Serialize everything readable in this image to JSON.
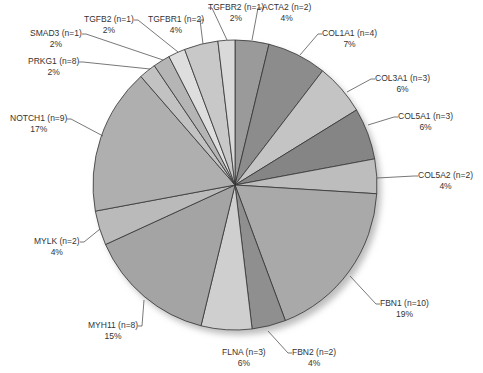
{
  "chart_data": {
    "type": "pie",
    "title": "",
    "start_angle_deg": 0,
    "direction": "clockwise",
    "slices": [
      {
        "label": "ACTA2 (n=2)",
        "gene": "ACTA2",
        "n": 2,
        "pct_label": "4%",
        "pct": 4,
        "color": "#9a9a9a"
      },
      {
        "label": "COL1A1 (n=4)",
        "gene": "COL1A1",
        "n": 4,
        "pct_label": "7%",
        "pct": 7,
        "color": "#8c8c8c"
      },
      {
        "label": "COL3A1 (n=3)",
        "gene": "COL3A1",
        "n": 3,
        "pct_label": "6%",
        "pct": 6,
        "color": "#c4c4c4"
      },
      {
        "label": "COL5A1 (n=3)",
        "gene": "COL5A1",
        "n": 3,
        "pct_label": "6%",
        "pct": 6,
        "color": "#858585"
      },
      {
        "label": "COL5A2 (n=2)",
        "gene": "COL5A2",
        "n": 2,
        "pct_label": "4%",
        "pct": 4,
        "color": "#bdbdbd"
      },
      {
        "label": "FBN1 (n=10)",
        "gene": "FBN1",
        "n": 10,
        "pct_label": "19%",
        "pct": 19,
        "color": "#a9a9a9"
      },
      {
        "label": "FBN2 (n=2)",
        "gene": "FBN2",
        "n": 2,
        "pct_label": "4%",
        "pct": 4,
        "color": "#8f8f8f"
      },
      {
        "label": "FLNA (n=3)",
        "gene": "FLNA",
        "n": 3,
        "pct_label": "6%",
        "pct": 6,
        "color": "#cfcfcf"
      },
      {
        "label": "MYH11 (n=8)",
        "gene": "MYH11",
        "n": 8,
        "pct_label": "15%",
        "pct": 15,
        "color": "#a4a4a4"
      },
      {
        "label": "MYLK (n=2)",
        "gene": "MYLK",
        "n": 2,
        "pct_label": "4%",
        "pct": 4,
        "color": "#bababa"
      },
      {
        "label": "NOTCH1 (n=9)",
        "gene": "NOTCH1",
        "n": 9,
        "pct_label": "17%",
        "pct": 17,
        "color": "#afafaf"
      },
      {
        "label": "PRKG1 (n=8)",
        "gene": "PRKG1",
        "n": 8,
        "pct_label": "2%",
        "pct": 2,
        "color": "#c2c2c2"
      },
      {
        "label": "SMAD3 (n=1)",
        "gene": "SMAD3",
        "n": 1,
        "pct_label": "2%",
        "pct": 2,
        "color": "#b5b5b5"
      },
      {
        "label": "TGFB2 (n=1)",
        "gene": "TGFB2",
        "n": 1,
        "pct_label": "2%",
        "pct": 2,
        "color": "#dedede"
      },
      {
        "label": "TGFBR1 (n=2)",
        "gene": "TGFBR1",
        "n": 2,
        "pct_label": "4%",
        "pct": 4,
        "color": "#c8c8c8"
      },
      {
        "label": "TGFBR2 (n=1)",
        "gene": "TGFBR2",
        "n": 1,
        "pct_label": "2%",
        "pct": 2,
        "color": "#d9d9d9"
      }
    ],
    "categories": [
      "ACTA2",
      "COL1A1",
      "COL3A1",
      "COL5A1",
      "COL5A2",
      "FBN1",
      "FBN2",
      "FLNA",
      "MYH11",
      "MYLK",
      "NOTCH1",
      "PRKG1",
      "SMAD3",
      "TGFB2",
      "TGFBR1",
      "TGFBR2"
    ],
    "values": [
      4,
      7,
      6,
      6,
      4,
      19,
      4,
      6,
      15,
      4,
      17,
      2,
      2,
      2,
      4,
      2
    ],
    "counts": [
      2,
      4,
      3,
      3,
      2,
      10,
      2,
      3,
      8,
      2,
      9,
      8,
      1,
      1,
      2,
      1
    ],
    "legend": "none (leader-line labels)",
    "grid": false
  },
  "labels": [
    {
      "name": "ACTA2",
      "line1": "ACTA2 (n=2)",
      "line2": "4%",
      "x": 262,
      "y": 2,
      "ax": 252,
      "ay": 40
    },
    {
      "name": "COL1A1",
      "line1": "COL1A1 (n=4)",
      "line2": "7%",
      "x": 322,
      "y": 28,
      "ax": 300,
      "ay": 55
    },
    {
      "name": "COL3A1",
      "line1": "COL3A1 (n=3)",
      "line2": "6%",
      "x": 375,
      "y": 73,
      "ax": 347,
      "ay": 92
    },
    {
      "name": "COL5A1",
      "line1": "COL5A1 (n=3)",
      "line2": "6%",
      "x": 398,
      "y": 111,
      "ax": 368,
      "ay": 125
    },
    {
      "name": "COL5A2",
      "line1": "COL5A2 (n=2)",
      "line2": "4%",
      "x": 418,
      "y": 170,
      "ax": 377,
      "ay": 178
    },
    {
      "name": "FBN1",
      "line1": "FBN1 (n=10)",
      "line2": "19%",
      "x": 380,
      "y": 298,
      "ax": 350,
      "ay": 276
    },
    {
      "name": "FBN2",
      "line1": "FBN2 (n=2)",
      "line2": "4%",
      "x": 292,
      "y": 347,
      "ax": 268,
      "ay": 331
    },
    {
      "name": "FLNA",
      "line1": "FLNA (n=3)",
      "line2": "6%",
      "x": 222,
      "y": 347,
      "ax": 0,
      "ay": 0
    },
    {
      "name": "MYH11",
      "line1": "MYH11 (n=8)",
      "line2": "15%",
      "x": 88,
      "y": 320,
      "ax": 144,
      "ay": 300
    },
    {
      "name": "MYLK",
      "line1": "MYLK (n=2)",
      "line2": "4%",
      "x": 34,
      "y": 236,
      "ax": 100,
      "ay": 229
    },
    {
      "name": "NOTCH1",
      "line1": "NOTCH1 (n=9)",
      "line2": "17%",
      "x": 10,
      "y": 113,
      "ax": 103,
      "ay": 136
    },
    {
      "name": "PRKG1",
      "line1": "PRKG1 (n=8)",
      "line2": "2%",
      "x": 28,
      "y": 56,
      "ax": 150,
      "ay": 69
    },
    {
      "name": "SMAD3",
      "line1": "SMAD3 (n=1)",
      "line2": "2%",
      "x": 30,
      "y": 28,
      "ax": 163,
      "ay": 60
    },
    {
      "name": "TGFB2",
      "line1": "TGFB2 (n=1)",
      "line2": "2%",
      "x": 84,
      "y": 14,
      "ax": 178,
      "ay": 52
    },
    {
      "name": "TGFBR1",
      "line1": "TGFBR1 (n=2)",
      "line2": "4%",
      "x": 148,
      "y": 14,
      "ax": 203,
      "ay": 44
    },
    {
      "name": "TGFBR2",
      "line1": "TGFBR2 (n=1)",
      "line2": "2%",
      "x": 208,
      "y": 2,
      "ax": 227,
      "ay": 40
    }
  ],
  "pie": {
    "cx": 235,
    "cy": 185,
    "rx": 142,
    "ry": 145,
    "stroke": "#333333",
    "shadow": "#bdbdbd"
  }
}
